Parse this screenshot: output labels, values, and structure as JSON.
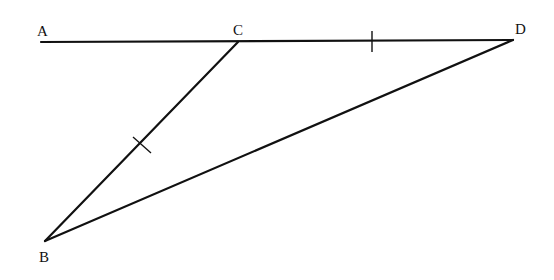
{
  "diagram": {
    "type": "geometry-figure",
    "points": {
      "A": {
        "label": "A",
        "x": 41,
        "y": 42,
        "label_x": 37,
        "label_y": 36
      },
      "C": {
        "label": "C",
        "x": 238,
        "y": 42,
        "label_x": 233,
        "label_y": 35
      },
      "D": {
        "label": "D",
        "x": 513,
        "y": 40,
        "label_x": 515,
        "label_y": 34
      },
      "B": {
        "label": "B",
        "x": 45,
        "y": 241,
        "label_x": 39,
        "label_y": 262
      }
    },
    "segments": [
      {
        "from": "A",
        "to": "D",
        "name": "line-AD"
      },
      {
        "from": "C",
        "to": "B",
        "name": "segment-CB"
      },
      {
        "from": "B",
        "to": "D",
        "name": "segment-BD"
      }
    ],
    "tick_marks": [
      {
        "segment": "CD",
        "meaning": "congruent",
        "x": 372,
        "y": 41
      },
      {
        "segment": "CB",
        "meaning": "congruent",
        "x": 141,
        "y": 145
      }
    ],
    "colors": {
      "stroke": "#111111",
      "background": "#ffffff"
    }
  }
}
